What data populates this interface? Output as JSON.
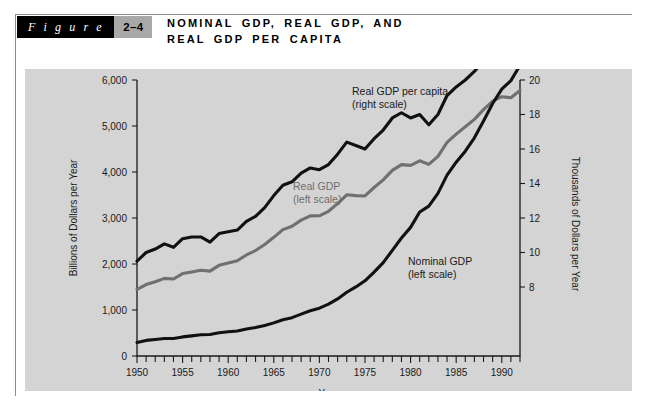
{
  "figure": {
    "word_label": "F i g u r e",
    "number": "2–4",
    "title_line1": "NOMINAL GDP, REAL GDP, AND",
    "title_line2": "REAL GDP PER CAPITA"
  },
  "colors": {
    "panel_background": "#d4d4d4",
    "page_background": "#ffffff",
    "figure_word_background": "#000000",
    "figure_number_background": "#a8a8a8",
    "nominal_gdp_line": "#111111",
    "real_gdp_line": "#707070",
    "real_gdp_per_capita_line": "#111111",
    "axis": "#1a1a1a"
  },
  "chart_data": {
    "type": "line",
    "title": "NOMINAL GDP, REAL GDP, AND REAL GDP PER CAPITA",
    "xlabel": "Year",
    "ylabel": "Billions of Dollars per Year",
    "y2label": "Thousands of Dollars per Year",
    "xlim": [
      1950,
      1992
    ],
    "ylim": [
      0,
      6000
    ],
    "y2lim": [
      4,
      20
    ],
    "grid": false,
    "legend_position": "inline-annotations",
    "xticks": [
      1950,
      1955,
      1960,
      1965,
      1970,
      1975,
      1980,
      1985,
      1990
    ],
    "xticklabels": [
      "1950",
      "1955",
      "1960",
      "1965",
      "1970",
      "1975",
      "1980",
      "1985",
      "1990"
    ],
    "xminor_tick_interval": 1,
    "yticks": [
      0,
      1000,
      2000,
      3000,
      4000,
      5000,
      6000
    ],
    "yticklabels": [
      "0",
      "1,000",
      "2,000",
      "3,000",
      "4,000",
      "5,000",
      "6,000"
    ],
    "y2ticks": [
      8,
      10,
      12,
      14,
      16,
      18,
      20
    ],
    "y2ticklabels": [
      "8",
      "10",
      "12",
      "14",
      "16",
      "18",
      "20"
    ],
    "annotations": [
      {
        "text_line1": "Real GDP per capita",
        "text_line2": "(right scale)",
        "color": "#1a1a1a"
      },
      {
        "text_line1": "Real GDP",
        "text_line2": "(left scale)",
        "color": "#6e6e6e"
      },
      {
        "text_line1": "Nominal GDP",
        "text_line2": "(left scale)",
        "color": "#1a1a1a"
      }
    ],
    "x": [
      1950,
      1951,
      1952,
      1953,
      1954,
      1955,
      1956,
      1957,
      1958,
      1959,
      1960,
      1961,
      1962,
      1963,
      1964,
      1965,
      1966,
      1967,
      1968,
      1969,
      1970,
      1971,
      1972,
      1973,
      1974,
      1975,
      1976,
      1977,
      1978,
      1979,
      1980,
      1981,
      1982,
      1983,
      1984,
      1985,
      1986,
      1987,
      1988,
      1989,
      1990,
      1991,
      1992
    ],
    "series": [
      {
        "name": "Nominal GDP",
        "axis": "left",
        "units": "Billions of Dollars per Year",
        "color": "#111111",
        "values": [
          294,
          339,
          358,
          379,
          380,
          415,
          438,
          461,
          467,
          507,
          527,
          545,
          586,
          618,
          664,
          720,
          788,
          833,
          910,
          985,
          1039,
          1128,
          1241,
          1386,
          1501,
          1635,
          1824,
          2031,
          2295,
          2566,
          2796,
          3131,
          3259,
          3535,
          3933,
          4213,
          4453,
          4743,
          5108,
          5489,
          5803,
          5986,
          6319
        ]
      },
      {
        "name": "Real GDP",
        "axis": "left",
        "units": "Billions of Dollars per Year",
        "color": "#707070",
        "values": [
          1449,
          1554,
          1613,
          1688,
          1673,
          1792,
          1827,
          1863,
          1845,
          1971,
          2023,
          2072,
          2197,
          2293,
          2424,
          2580,
          2748,
          2819,
          2954,
          3046,
          3048,
          3146,
          3313,
          3504,
          3486,
          3479,
          3663,
          3830,
          4036,
          4160,
          4145,
          4244,
          4165,
          4340,
          4644,
          4824,
          4982,
          5145,
          5357,
          5539,
          5637,
          5614,
          5770
        ]
      },
      {
        "name": "Real GDP per capita",
        "axis": "right",
        "units": "Thousands of Dollars per Year",
        "color": "#111111",
        "values": [
          9.5,
          10.0,
          10.2,
          10.5,
          10.3,
          10.8,
          10.9,
          10.9,
          10.6,
          11.1,
          11.2,
          11.3,
          11.8,
          12.1,
          12.6,
          13.3,
          13.9,
          14.1,
          14.6,
          14.9,
          14.8,
          15.1,
          15.7,
          16.4,
          16.2,
          16.0,
          16.6,
          17.1,
          17.8,
          18.1,
          17.8,
          18.0,
          17.4,
          18.0,
          19.1,
          19.6,
          20.0,
          20.5,
          21.1,
          21.5,
          21.6,
          21.2,
          21.5
        ]
      }
    ]
  }
}
